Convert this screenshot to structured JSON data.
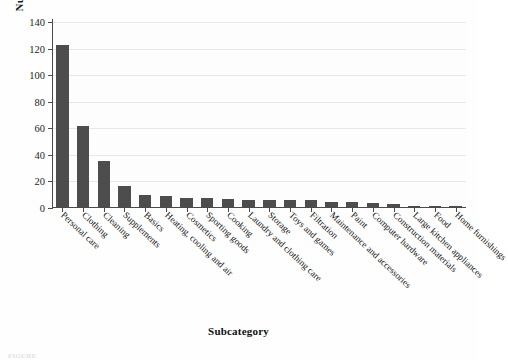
{
  "chart_data": {
    "type": "bar",
    "title": "",
    "xlabel": "Subcategory",
    "ylabel": "Number of products",
    "ylim": [
      0,
      140
    ],
    "yticks": [
      0,
      20,
      40,
      60,
      80,
      100,
      120,
      140
    ],
    "grid": true,
    "legend": false,
    "bar_color": "#4d4d4d",
    "categories": [
      "Personal care",
      "Clothing",
      "Cleaning",
      "Supplements",
      "Basics",
      "Heating, cooling and air",
      "Cosmetics",
      "Sporting goods",
      "Cooking",
      "Laundry and clothing care",
      "Storage",
      "Toys and games",
      "Filtration",
      "Maintenance and accessories",
      "Paint",
      "Computer hardware",
      "Construction materials",
      "Large kitchen appliances",
      "Food",
      "Home furnishings"
    ],
    "values": [
      122,
      61,
      35,
      16,
      9,
      8,
      7,
      7,
      6,
      5,
      5,
      5,
      5,
      4,
      4,
      3,
      2,
      1,
      1,
      1
    ]
  },
  "axes": {
    "y_tick_labels": [
      "0",
      "20",
      "40",
      "60",
      "80",
      "100",
      "120",
      "140"
    ],
    "y_axis_title": "Number of products",
    "x_axis_title": "Subcategory"
  },
  "caption": {
    "text": "FIGURE"
  }
}
